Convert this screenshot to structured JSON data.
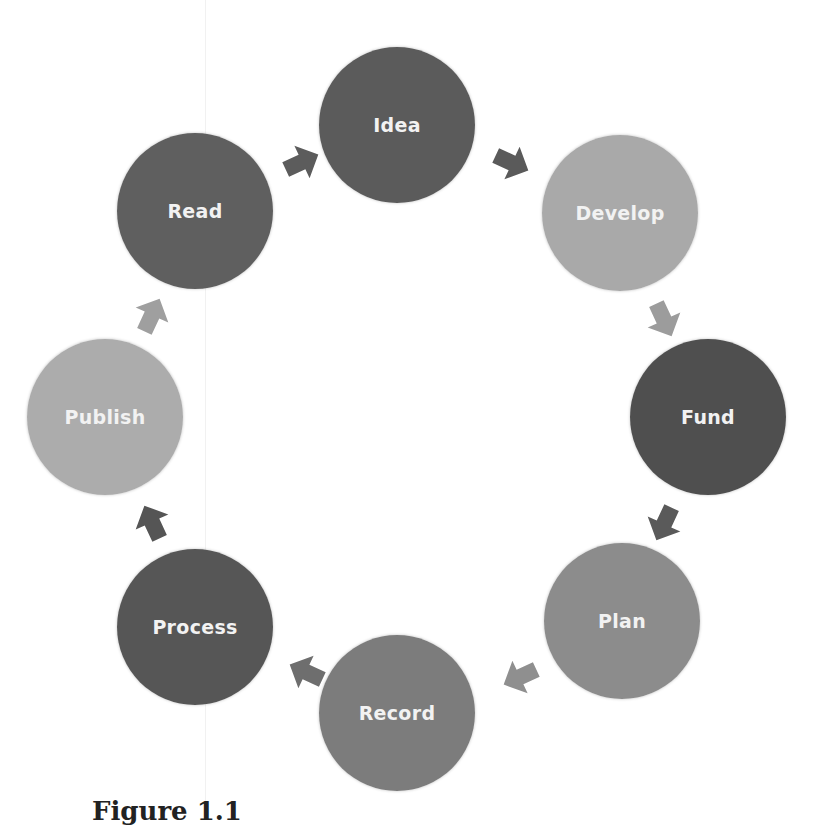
{
  "diagram": {
    "type": "cycle",
    "nodes": [
      {
        "label": "Idea",
        "color": "#5b5b5b"
      },
      {
        "label": "Develop",
        "color": "#a9a9a9"
      },
      {
        "label": "Fund",
        "color": "#4f4f4f"
      },
      {
        "label": "Plan",
        "color": "#8c8c8c"
      },
      {
        "label": "Record",
        "color": "#7c7c7c"
      },
      {
        "label": "Process",
        "color": "#565656"
      },
      {
        "label": "Publish",
        "color": "#acacac"
      },
      {
        "label": "Read",
        "color": "#5f5f5f"
      }
    ],
    "arrow_colors": [
      "#5a5a5a",
      "#9c9c9c",
      "#5a5a5a",
      "#8f8f8f",
      "#6e6e6e",
      "#555555",
      "#9f9f9f",
      "#5c5c5c"
    ],
    "caption": "Figure 1.1"
  }
}
